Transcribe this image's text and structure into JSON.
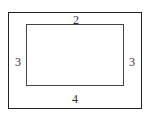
{
  "diagram": {
    "type": "frame-with-margins",
    "margins": {
      "top": "2",
      "left": "3",
      "right": "3",
      "bottom": "4"
    }
  }
}
